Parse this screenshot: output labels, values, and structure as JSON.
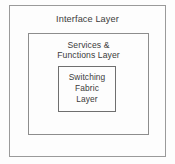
{
  "diagram": {
    "type": "nested-layer-diagram",
    "canvas": {
      "width": 175,
      "height": 164,
      "background_color": "#fdfdfd"
    },
    "style": {
      "border_color": "#8a8a8a",
      "text_color": "#3b3b3b"
    },
    "layers": [
      {
        "id": "interface",
        "label": "Interface Layer",
        "level": 1,
        "box": {
          "x": 9,
          "y": 5,
          "width": 157,
          "height": 152
        }
      },
      {
        "id": "services-functions",
        "label": "Services &\nFunctions Layer",
        "level": 2,
        "box": {
          "x": 27,
          "y": 32,
          "width": 121,
          "height": 102
        }
      },
      {
        "id": "switching-fabric",
        "label": "Switching\nFabric\nLayer",
        "level": 3,
        "box": {
          "x": 56,
          "y": 64,
          "width": 58,
          "height": 46
        }
      }
    ]
  }
}
